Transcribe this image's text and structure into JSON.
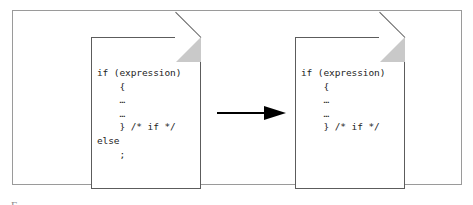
{
  "figure": {
    "type": "before-after transformation diagram",
    "documents": [
      {
        "id": "before",
        "role": "before",
        "code": "if (expression)\n    {\n    …\n    …\n    } /* if */\nelse\n    ;"
      },
      {
        "id": "after",
        "role": "after",
        "code": "if (expression)\n    {\n    …\n    …\n    } /* if */"
      }
    ],
    "arrow": {
      "direction": "right",
      "meaning": "transforms into"
    },
    "caption_fragment": "F",
    "colors": {
      "frame_border": "#9a9a9a",
      "document_border": "#5c5c5c",
      "fold_fill": "#c9c9c9",
      "code_text": "#1d1d1d",
      "arrow": "#000000",
      "background": "#ffffff"
    }
  }
}
